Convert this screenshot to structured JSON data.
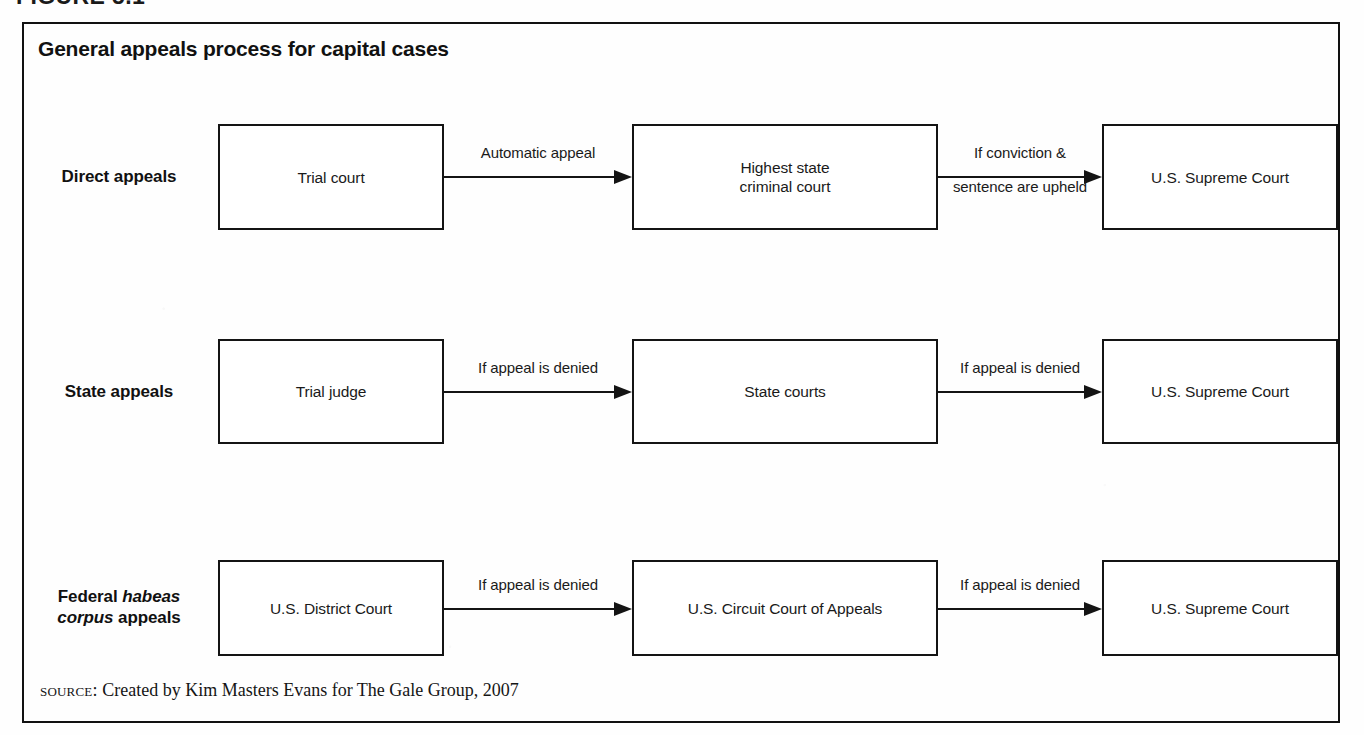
{
  "figure": {
    "header": "FIGURE 5.1",
    "title": "General appeals process for capital cases",
    "frame_color": "#111111",
    "text_color": "#1a1a1a",
    "background": "#ffffff"
  },
  "diagram_data": {
    "type": "flowchart",
    "orientation": "left-to-right",
    "rows": [
      {
        "label_html": "Direct appeals",
        "label_text": "Direct appeals",
        "nodes": [
          {
            "text": "Trial court"
          },
          {
            "text": "Highest state\ncriminal court"
          },
          {
            "text": "U.S. Supreme Court"
          }
        ],
        "edges": [
          {
            "above": "Automatic appeal",
            "below": ""
          },
          {
            "above": "If conviction &",
            "below": "sentence are upheld"
          }
        ]
      },
      {
        "label_html": "State appeals",
        "label_text": "State appeals",
        "nodes": [
          {
            "text": "Trial judge"
          },
          {
            "text": "State courts"
          },
          {
            "text": "U.S. Supreme Court"
          }
        ],
        "edges": [
          {
            "above": "If appeal is denied",
            "below": ""
          },
          {
            "above": "If appeal is denied",
            "below": ""
          }
        ]
      },
      {
        "label_html": "Federal <em>habeas<br>corpus</em> appeals",
        "label_text": "Federal habeas corpus appeals",
        "nodes": [
          {
            "text": "U.S. District Court"
          },
          {
            "text": "U.S. Circuit Court of Appeals"
          },
          {
            "text": "U.S. Supreme Court"
          }
        ],
        "edges": [
          {
            "above": "If appeal is denied",
            "below": ""
          },
          {
            "above": "If appeal is denied",
            "below": ""
          }
        ]
      }
    ]
  },
  "source": {
    "label": "source:",
    "text": "Created by Kim Masters Evans for The Gale Group, 2007"
  }
}
